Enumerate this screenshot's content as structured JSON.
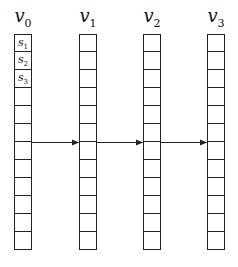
{
  "diagram": {
    "columns": [
      {
        "name": "v",
        "sub": "0",
        "x": 14
      },
      {
        "name": "v",
        "sub": "1",
        "x": 79
      },
      {
        "name": "v",
        "sub": "2",
        "x": 143
      },
      {
        "name": "v",
        "sub": "3",
        "x": 207
      }
    ],
    "cells_per_column": 12,
    "cell_size": 18,
    "first_column_labels": [
      {
        "name": "s",
        "sub": "1"
      },
      {
        "name": "s",
        "sub": "2"
      },
      {
        "name": "s",
        "sub": "3"
      }
    ],
    "arrow_row_y": 142,
    "arrows": [
      {
        "from": "v0",
        "to": "v1"
      },
      {
        "from": "v1",
        "to": "v2"
      },
      {
        "from": "v2",
        "to": "v3"
      }
    ],
    "line_color": "#222222"
  }
}
